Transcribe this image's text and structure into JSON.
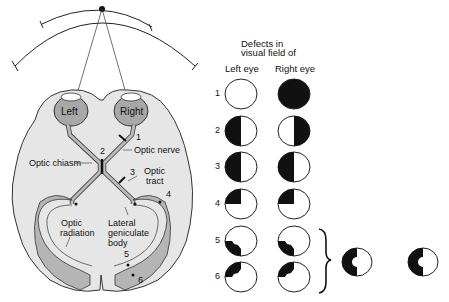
{
  "diagram": {
    "eyes": {
      "left": "Left",
      "right": "Right"
    },
    "structures": {
      "optic_nerve": "Optic nerve",
      "optic_chiasm": "Optic chiasm",
      "optic_tract": [
        "Optic",
        "tract"
      ],
      "optic_radiation": [
        "Optic",
        "radiation"
      ],
      "lgb": [
        "Lateral",
        "geniculate",
        "body"
      ]
    },
    "lesion_numbers": [
      "1",
      "2",
      "3",
      "4",
      "5",
      "6"
    ],
    "colors": {
      "brain": "#e6e6e6",
      "pathway": "#b5b5b5",
      "eye": "#a8a8a8",
      "defect": "#111111",
      "outline": "#333333"
    }
  },
  "defects_table": {
    "header_line1": "Defects in",
    "header_line2": "visual field of",
    "col_left": "Left eye",
    "col_right": "Right eye",
    "rows": [
      {
        "n": "1",
        "left": "none",
        "right": "total blindness"
      },
      {
        "n": "2",
        "left": "temporal hemianopia (left half)",
        "right": "temporal hemianopia (right half)"
      },
      {
        "n": "3",
        "left": "left homonymous hemianopia",
        "right": "left homonymous hemianopia"
      },
      {
        "n": "4",
        "left": "upper left quadrantanopia",
        "right": "upper left quadrantanopia"
      },
      {
        "n": "5",
        "left": "lower left quadrant partial",
        "right": "lower left quadrant partial"
      },
      {
        "n": "6",
        "left": "upper left quadrant partial",
        "right": "upper left quadrant partial"
      }
    ],
    "combined": [
      "left hemianopia with macular sparing (left eye)",
      "left hemianopia with macular sparing (right eye)"
    ]
  }
}
